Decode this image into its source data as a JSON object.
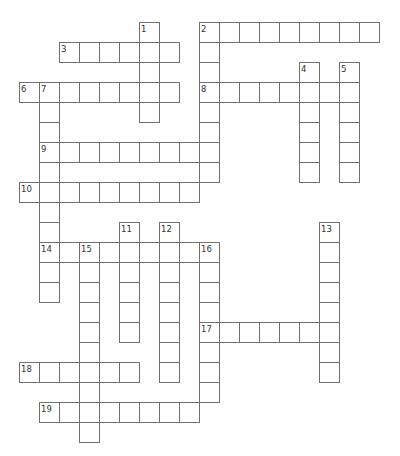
{
  "puzzle": {
    "type": "crossword",
    "cell_size": 20,
    "origin": {
      "x": 19,
      "y": 22
    },
    "colors": {
      "grid_line": "#707070",
      "cell_bg": "#ffffff",
      "number": "#333333",
      "page_bg": "#ffffff"
    },
    "words": [
      {
        "number": "1",
        "direction": "down",
        "row": 0,
        "col": 6,
        "length": 5
      },
      {
        "number": "2",
        "direction": "across",
        "row": 0,
        "col": 9,
        "length": 9
      },
      {
        "number": "2",
        "direction": "down",
        "row": 0,
        "col": 9,
        "length": 8
      },
      {
        "number": "3",
        "direction": "across",
        "row": 1,
        "col": 2,
        "length": 6
      },
      {
        "number": "4",
        "direction": "down",
        "row": 2,
        "col": 14,
        "length": 6
      },
      {
        "number": "5",
        "direction": "down",
        "row": 2,
        "col": 16,
        "length": 6
      },
      {
        "number": "6",
        "direction": "across",
        "row": 3,
        "col": 0,
        "length": 8
      },
      {
        "number": "7",
        "direction": "down",
        "row": 3,
        "col": 1,
        "length": 11
      },
      {
        "number": "8",
        "direction": "across",
        "row": 3,
        "col": 9,
        "length": 8
      },
      {
        "number": "9",
        "direction": "across",
        "row": 6,
        "col": 1,
        "length": 9
      },
      {
        "number": "10",
        "direction": "across",
        "row": 8,
        "col": 0,
        "length": 9
      },
      {
        "number": "11",
        "direction": "down",
        "row": 10,
        "col": 5,
        "length": 6
      },
      {
        "number": "12",
        "direction": "down",
        "row": 10,
        "col": 7,
        "length": 8
      },
      {
        "number": "13",
        "direction": "down",
        "row": 10,
        "col": 15,
        "length": 8
      },
      {
        "number": "14",
        "direction": "across",
        "row": 11,
        "col": 1,
        "length": 9
      },
      {
        "number": "15",
        "direction": "down",
        "row": 11,
        "col": 3,
        "length": 10
      },
      {
        "number": "16",
        "direction": "down",
        "row": 11,
        "col": 9,
        "length": 8
      },
      {
        "number": "17",
        "direction": "across",
        "row": 15,
        "col": 9,
        "length": 7
      },
      {
        "number": "18",
        "direction": "across",
        "row": 17,
        "col": 0,
        "length": 6
      },
      {
        "number": "19",
        "direction": "across",
        "row": 19,
        "col": 1,
        "length": 8
      }
    ]
  }
}
